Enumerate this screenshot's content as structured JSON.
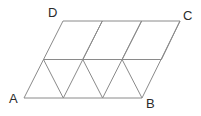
{
  "figure": {
    "kind": "geometry-diagram",
    "canvas": {
      "width": 201,
      "height": 116
    },
    "style": {
      "line_color": "#8a8a8a",
      "line_width": 1,
      "label_color": "#2b2b2b",
      "background": "#ffffff"
    },
    "labels": {
      "A": "A",
      "B": "B",
      "C": "C",
      "D": "D"
    },
    "vertices": {
      "A": {
        "x": 24,
        "y": 98
      },
      "B": {
        "x": 142,
        "y": 98
      },
      "C": {
        "x": 180,
        "y": 21
      },
      "D": {
        "x": 63,
        "y": 21
      }
    },
    "grid": {
      "rows": 2,
      "cols": 3,
      "cell_width": 39.333,
      "row_height": 38.5,
      "shear_per_row": 19.5,
      "triangle_count": 12,
      "row_y": [
        98,
        59.5,
        21
      ],
      "row_x_start": [
        24,
        43.5,
        63
      ],
      "horizontal_segments": [
        {
          "name": "bottom-edge-AB",
          "x1": 24,
          "y1": 98,
          "x2": 142,
          "y2": 98
        },
        {
          "name": "middle-line",
          "x1": 43.5,
          "y1": 59.5,
          "x2": 161.5,
          "y2": 59.5
        },
        {
          "name": "top-edge-DC",
          "x1": 63,
          "y1": 21,
          "x2": 180,
          "y2": 21
        }
      ],
      "up_right_segments": [
        {
          "x1": 24,
          "y1": 98,
          "x2": 63,
          "y2": 21
        },
        {
          "x1": 63.3,
          "y1": 98,
          "x2": 102.3,
          "y2": 21
        },
        {
          "x1": 102.6,
          "y1": 98,
          "x2": 141.6,
          "y2": 21
        },
        {
          "x1": 142,
          "y1": 98,
          "x2": 180,
          "y2": 21
        }
      ],
      "up_left_segments": [
        {
          "x1": 63.3,
          "y1": 98,
          "x2": 43.5,
          "y2": 59.5
        },
        {
          "x1": 102.6,
          "y1": 98,
          "x2": 82.8,
          "y2": 59.5
        },
        {
          "x1": 142,
          "y1": 98,
          "x2": 122.1,
          "y2": 59.5
        },
        {
          "x1": 102.3,
          "y1": 21,
          "x2": 82.8,
          "y2": 59.5
        },
        {
          "x1": 141.6,
          "y1": 21,
          "x2": 122.1,
          "y2": 59.5
        },
        {
          "x1": 180,
          "y1": 21,
          "x2": 161.5,
          "y2": 59.5
        }
      ]
    }
  }
}
